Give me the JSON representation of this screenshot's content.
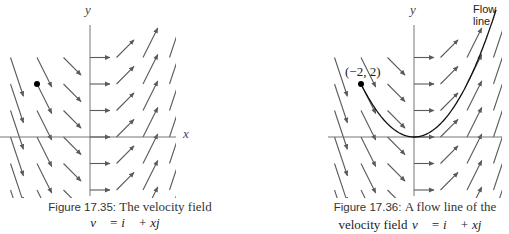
{
  "figures": [
    {
      "id": "fig-17-35",
      "caption_label": "Figure 17.35:",
      "caption_text": "The velocity field",
      "caption_math": "v⃗ = i⃗ + xj⃗",
      "axis_x_label": "x",
      "axis_y_label": "y"
    },
    {
      "id": "fig-17-36",
      "caption_label": "Figure 17.36:",
      "caption_text": "A flow line of the",
      "caption_text2": "velocity field",
      "caption_math": "v⃗ = i⃗ + xj⃗",
      "axis_y_label": "y",
      "flow_line_label": "Flow line",
      "point_label": "(−2, 2)"
    }
  ],
  "colors": {
    "arrow": "#5a5a5a",
    "axis": "#666666",
    "curve": "#111111",
    "dot": "#000000"
  },
  "chart_data": [
    {
      "type": "vector_field",
      "title": "Figure 17.35: The velocity field v = i + xj",
      "field": {
        "vx": "1",
        "vy": "x"
      },
      "grid_x": [
        -3,
        -2,
        -1,
        0,
        1,
        2,
        3
      ],
      "grid_y": [
        3,
        2,
        1,
        0,
        -1,
        -2,
        -3
      ],
      "xlabel": "x",
      "ylabel": "y",
      "marked_point": [
        -2,
        2
      ],
      "origin_px": [
        90,
        137
      ],
      "cell_px": 26.5,
      "axis_extent_px": {
        "x": [
          0,
          176
        ],
        "y": [
          25,
          196
        ]
      }
    },
    {
      "type": "vector_field",
      "title": "Figure 17.36: A flow line of the velocity field v = i + xj",
      "field": {
        "vx": "1",
        "vy": "x"
      },
      "grid_x": [
        -3,
        -2,
        -1,
        0,
        1,
        2,
        3
      ],
      "grid_y": [
        3,
        2,
        1,
        0,
        -1,
        -2,
        -3
      ],
      "ylabel": "y",
      "marked_point": [
        -2,
        2
      ],
      "marked_point_label": "(−2, 2)",
      "flow_line": {
        "equation": "y = x^2/2",
        "x_range": [
          -2,
          3.1
        ],
        "label": "Flow line"
      },
      "origin_px": [
        414,
        137
      ],
      "cell_px": 26.5,
      "axis_extent_px": {
        "x": [
          328,
          502
        ],
        "y": [
          25,
          196
        ]
      }
    }
  ]
}
